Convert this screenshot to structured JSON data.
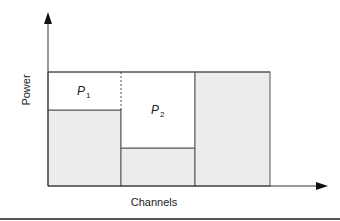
{
  "diagram": {
    "type": "water-filling power allocation",
    "y_axis_label": "Power",
    "x_axis_label": "Channels",
    "water_level_label": "",
    "channels": [
      {
        "name": "channel-1",
        "noise_level": "medium",
        "allocated_power_label": "P",
        "allocated_power_subscript": "1"
      },
      {
        "name": "channel-2",
        "noise_level": "low",
        "allocated_power_label": "P",
        "allocated_power_subscript": "2"
      },
      {
        "name": "channel-3",
        "noise_level": "high",
        "allocated_power_label": "",
        "allocated_power_subscript": ""
      }
    ],
    "colors": {
      "noise_fill": "#ececec",
      "power_fill": "#ffffff",
      "stroke": "#555555",
      "axis": "#333333"
    }
  }
}
